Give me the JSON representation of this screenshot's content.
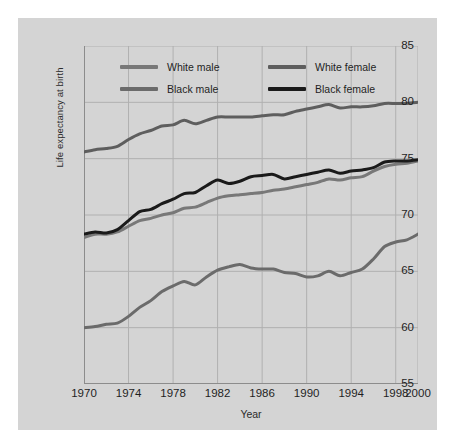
{
  "figure": {
    "background_color": "#d4d4d4",
    "page_background_color": "#ffffff",
    "plot_background_color": "#d4d4d4",
    "gridline_color": "#b0b0b0",
    "axis_color": "#8c8c8c"
  },
  "chart_data": {
    "type": "line",
    "title": "",
    "xlabel": "Year",
    "ylabel": "Life expectancy at birth",
    "xlim": [
      1970,
      2000
    ],
    "ylim": [
      55,
      85
    ],
    "xticks": [
      1970,
      1974,
      1978,
      1982,
      1986,
      1990,
      1994,
      1998,
      2000
    ],
    "xtick_labels": [
      "1970",
      "1974",
      "1978",
      "1982",
      "1986",
      "1990",
      "1994",
      "1998",
      "2000"
    ],
    "yticks": [
      55,
      60,
      65,
      70,
      75,
      80,
      85
    ],
    "ytick_labels": [
      "55",
      "60",
      "65",
      "70",
      "75",
      "80",
      "85"
    ],
    "grid": true,
    "legend_position": "top-center-inside",
    "x": [
      1970,
      1971,
      1972,
      1973,
      1974,
      1975,
      1976,
      1977,
      1978,
      1979,
      1980,
      1981,
      1982,
      1983,
      1984,
      1985,
      1986,
      1987,
      1988,
      1989,
      1990,
      1991,
      1992,
      1993,
      1994,
      1995,
      1996,
      1997,
      1998,
      1999,
      2000
    ],
    "series": [
      {
        "name": "White female",
        "color": "#5e5e5e",
        "width": 3.0,
        "values": [
          75.6,
          75.8,
          75.9,
          76.1,
          76.7,
          77.2,
          77.5,
          77.9,
          78.0,
          78.4,
          78.1,
          78.4,
          78.7,
          78.7,
          78.7,
          78.7,
          78.8,
          78.9,
          78.9,
          79.2,
          79.4,
          79.6,
          79.8,
          79.5,
          79.6,
          79.6,
          79.7,
          79.9,
          79.9,
          79.9,
          80.0
        ]
      },
      {
        "name": "Black female",
        "color": "#1a1a1a",
        "width": 3.0,
        "values": [
          68.3,
          68.5,
          68.4,
          68.7,
          69.5,
          70.3,
          70.5,
          71.0,
          71.4,
          71.9,
          72.0,
          72.6,
          73.1,
          72.8,
          73.0,
          73.4,
          73.5,
          73.6,
          73.2,
          73.4,
          73.6,
          73.8,
          74.0,
          73.7,
          73.9,
          74.0,
          74.2,
          74.7,
          74.8,
          74.8,
          74.9
        ]
      },
      {
        "name": "White male",
        "color": "#787878",
        "width": 3.0,
        "values": [
          68.0,
          68.3,
          68.3,
          68.5,
          69.0,
          69.5,
          69.7,
          70.0,
          70.2,
          70.6,
          70.7,
          71.1,
          71.5,
          71.7,
          71.8,
          71.9,
          72.0,
          72.2,
          72.3,
          72.5,
          72.7,
          72.9,
          73.2,
          73.1,
          73.3,
          73.4,
          73.9,
          74.3,
          74.5,
          74.6,
          74.8
        ]
      },
      {
        "name": "Black male",
        "color": "#6b6b6b",
        "width": 3.0,
        "values": [
          60.0,
          60.1,
          60.3,
          60.4,
          61.0,
          61.8,
          62.4,
          63.2,
          63.7,
          64.1,
          63.8,
          64.5,
          65.1,
          65.4,
          65.6,
          65.3,
          65.2,
          65.2,
          64.9,
          64.8,
          64.5,
          64.6,
          65.0,
          64.6,
          64.9,
          65.2,
          66.1,
          67.2,
          67.6,
          67.8,
          68.3
        ]
      }
    ],
    "legend": [
      {
        "label": "White male",
        "color": "#787878"
      },
      {
        "label": "White female",
        "color": "#5e5e5e"
      },
      {
        "label": "Black male",
        "color": "#6b6b6b"
      },
      {
        "label": "Black female",
        "color": "#1a1a1a"
      }
    ]
  }
}
